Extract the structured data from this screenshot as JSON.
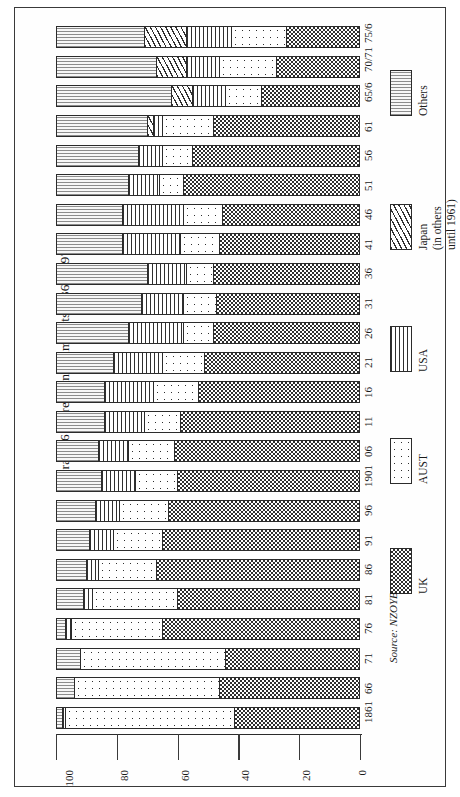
{
  "figure": {
    "title": "Graph 6:  Direction of imports, 1861–1976",
    "source": "Source: NZOYB"
  },
  "legend": {
    "items": [
      {
        "label": "UK",
        "pattern": "checkerboard"
      },
      {
        "label": "AUST",
        "pattern": "dots"
      },
      {
        "label": "USA",
        "pattern": "vertical-lines"
      },
      {
        "label": "Japan",
        "note1": "(in others",
        "note2": "until 1961)",
        "pattern": "wavy-lines"
      },
      {
        "label": "Others",
        "pattern": "horizontal-lines"
      }
    ]
  },
  "axis": {
    "value_ticks": [
      "0",
      "20",
      "40",
      "60",
      "80",
      "100"
    ],
    "value_min": 0,
    "value_max": 100
  },
  "chart_data": {
    "type": "bar",
    "orientation": "horizontal-stacked-100",
    "title": "Graph 6:  Direction of imports, 1861–1976",
    "xlabel": "",
    "ylabel": "",
    "ylim": [
      0,
      100
    ],
    "grid": false,
    "legend_position": "right",
    "categories": [
      "1861",
      "66",
      "71",
      "76",
      "81",
      "86",
      "91",
      "96",
      "1901",
      "06",
      "11",
      "16",
      "21",
      "26",
      "31",
      "36",
      "41",
      "46",
      "51",
      "56",
      "61",
      "65/6",
      "70/71",
      "75/6"
    ],
    "series": [
      {
        "name": "UK",
        "values": [
          41,
          46,
          44,
          65,
          60,
          67,
          65,
          63,
          60,
          61,
          59,
          53,
          51,
          48,
          47,
          48,
          46,
          45,
          58,
          55,
          48,
          32,
          27,
          24
        ]
      },
      {
        "name": "AUST",
        "values": [
          56,
          48,
          48,
          30,
          28,
          19,
          16,
          16,
          14,
          15,
          12,
          15,
          14,
          10,
          11,
          9,
          13,
          13,
          8,
          10,
          17,
          12,
          19,
          18
        ]
      },
      {
        "name": "USA",
        "values": [
          1,
          0,
          0,
          2,
          3,
          4,
          8,
          8,
          11,
          10,
          13,
          16,
          16,
          18,
          14,
          13,
          19,
          20,
          10,
          8,
          3,
          11,
          11,
          15
        ]
      },
      {
        "name": "Japan",
        "values": [
          0,
          0,
          0,
          0,
          0,
          0,
          0,
          0,
          0,
          0,
          0,
          0,
          0,
          0,
          0,
          0,
          0,
          0,
          0,
          0,
          2,
          7,
          10,
          14
        ]
      },
      {
        "name": "Others",
        "values": [
          2,
          6,
          8,
          3,
          9,
          10,
          11,
          13,
          15,
          14,
          16,
          16,
          19,
          24,
          28,
          30,
          22,
          22,
          24,
          27,
          30,
          38,
          33,
          29
        ]
      }
    ]
  }
}
